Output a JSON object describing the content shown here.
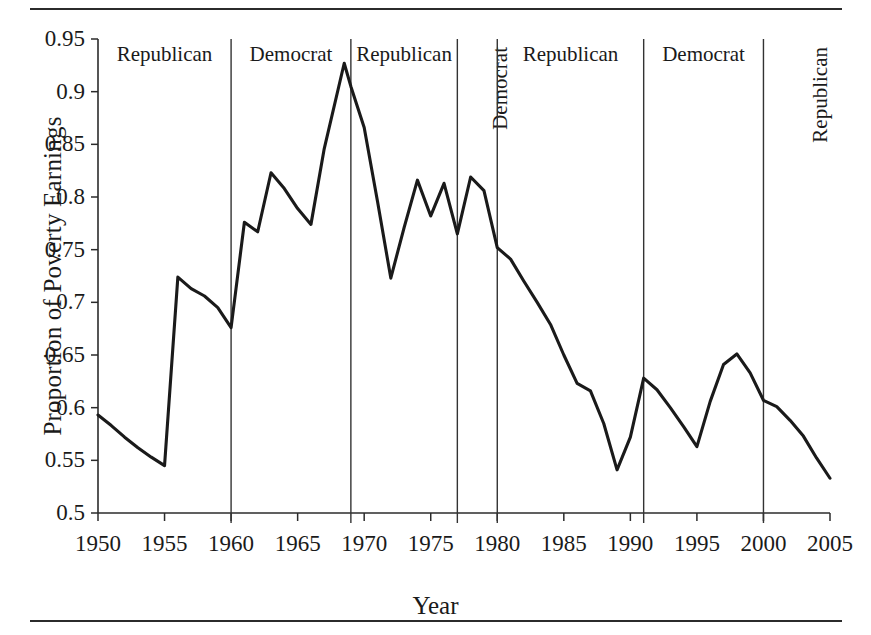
{
  "figure": {
    "top_rule": "",
    "bottom_rule": ""
  },
  "chart_data": {
    "type": "line",
    "title": "",
    "xlabel": "Year",
    "ylabel": "Proportion of Poverty Earnings",
    "xlim": [
      1950,
      2005
    ],
    "ylim": [
      0.5,
      0.95
    ],
    "grid": false,
    "legend": "none",
    "line_color": "#1a1a1a",
    "xticks": [
      1950,
      1955,
      1960,
      1965,
      1970,
      1975,
      1980,
      1985,
      1990,
      1995,
      2000,
      2005
    ],
    "xtick_labels": [
      "1950",
      "1955",
      "1960",
      "1965",
      "1970",
      "1975",
      "1980",
      "1985",
      "1990",
      "1995",
      "2000",
      "2005"
    ],
    "yticks": [
      0.5,
      0.55,
      0.6,
      0.65,
      0.7,
      0.75,
      0.8,
      0.85,
      0.9,
      0.95
    ],
    "ytick_labels": [
      "0.5",
      "0.55",
      "0.6",
      "0.65",
      "0.7",
      "0.75",
      "0.8",
      "0.85",
      "0.9",
      "0.95"
    ],
    "x": [
      1950,
      1951,
      1952,
      1953,
      1954,
      1955,
      1956,
      1957,
      1958,
      1959,
      1960,
      1961,
      1962,
      1963,
      1964,
      1965,
      1966,
      1967,
      1968.5,
      1969,
      1970,
      1971,
      1972,
      1973,
      1974,
      1975,
      1976,
      1977,
      1978,
      1979,
      1980,
      1981,
      1982,
      1983,
      1984,
      1985,
      1986,
      1987,
      1988,
      1989,
      1990,
      1991,
      1992,
      1993,
      1994,
      1995,
      1996,
      1997,
      1998,
      1999,
      2000,
      2001,
      2002,
      2003,
      2004,
      2005
    ],
    "values": [
      0.593,
      0.583,
      0.572,
      0.562,
      0.553,
      0.545,
      0.724,
      0.713,
      0.706,
      0.695,
      0.676,
      0.776,
      0.767,
      0.823,
      0.808,
      0.789,
      0.774,
      0.846,
      0.927,
      0.905,
      0.866,
      0.796,
      0.723,
      0.771,
      0.816,
      0.782,
      0.813,
      0.765,
      0.819,
      0.806,
      0.752,
      0.741,
      0.72,
      0.7,
      0.679,
      0.65,
      0.623,
      0.616,
      0.585,
      0.541,
      0.572,
      0.628,
      0.617,
      0.6,
      0.582,
      0.563,
      0.606,
      0.641,
      0.651,
      0.633,
      0.607,
      0.601,
      0.588,
      0.573,
      0.552,
      0.533
    ],
    "annotations": [
      {
        "label": "Republican",
        "orientation": "horizontal",
        "start_year": 1950,
        "end_year": 1960
      },
      {
        "label": "Democrat",
        "orientation": "horizontal",
        "start_year": 1960,
        "end_year": 1969
      },
      {
        "label": "Republican",
        "orientation": "horizontal",
        "start_year": 1969,
        "end_year": 1977
      },
      {
        "label": "Democrat",
        "orientation": "vertical",
        "start_year": 1977,
        "end_year": 1980
      },
      {
        "label": "Republican",
        "orientation": "horizontal",
        "start_year": 1980,
        "end_year": 1991
      },
      {
        "label": "Democrat",
        "orientation": "horizontal",
        "start_year": 1991,
        "end_year": 2000
      },
      {
        "label": "Republican",
        "orientation": "vertical",
        "start_year": 2000,
        "end_year": 2005
      }
    ],
    "era_dividers": [
      1960,
      1969,
      1977,
      1980,
      1991,
      2000
    ]
  }
}
